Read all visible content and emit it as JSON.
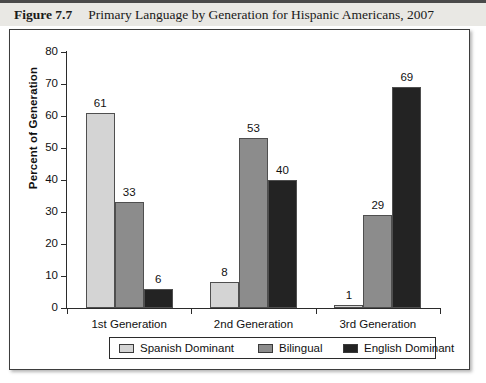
{
  "figure": {
    "number_label": "Figure 7.7",
    "caption": "Primary Language by Generation for Hispanic Americans, 2007"
  },
  "chart_data": {
    "type": "bar",
    "title": "Primary Language by Generation for Hispanic Americans, 2007",
    "xlabel": "",
    "ylabel": "Percent of Generation",
    "ylim": [
      0,
      80
    ],
    "yticks": [
      0,
      10,
      20,
      30,
      40,
      50,
      60,
      70,
      80
    ],
    "grid": false,
    "legend_position": "bottom",
    "categories": [
      "1st Generation",
      "2nd Generation",
      "3rd Generation"
    ],
    "series": [
      {
        "name": "Spanish Dominant",
        "color": "#d4d4d4",
        "values": [
          61,
          8,
          1
        ]
      },
      {
        "name": "Bilingual",
        "color": "#8c8c8c",
        "values": [
          33,
          53,
          29
        ]
      },
      {
        "name": "English Dominant",
        "color": "#232323",
        "values": [
          6,
          40,
          69
        ]
      }
    ]
  }
}
